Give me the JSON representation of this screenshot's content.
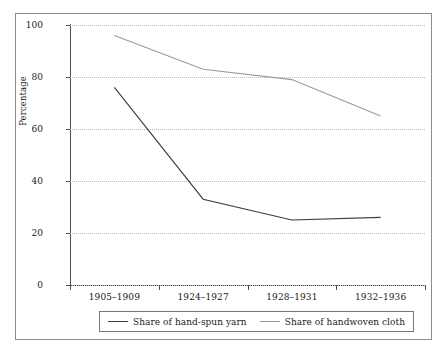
{
  "chart_data": {
    "type": "line",
    "title": "",
    "subtitle": "",
    "xlabel": "",
    "ylabel": "Percentage",
    "categories": [
      "1905–1909",
      "1924–1927",
      "1928–1931",
      "1932–1936"
    ],
    "series": [
      {
        "name": "Share of hand-spun yarn",
        "color": "#3c3c3c",
        "values": [
          76,
          33,
          25,
          26
        ]
      },
      {
        "name": "Share of handwoven cloth",
        "color": "#9a9a9a",
        "values": [
          96,
          83,
          79,
          65
        ]
      }
    ],
    "ylim": [
      0,
      100
    ],
    "yticks": [
      0,
      20,
      40,
      60,
      80,
      100
    ],
    "ytick_labels": [
      "0",
      "20",
      "40",
      "60",
      "80",
      "100"
    ],
    "grid": true,
    "grid_axis": "y",
    "grid_style": "dotted",
    "legend_position": "bottom-center",
    "legend_entries": [
      "Share of hand-spun yarn",
      "Share of handwoven cloth"
    ],
    "frame": true
  }
}
